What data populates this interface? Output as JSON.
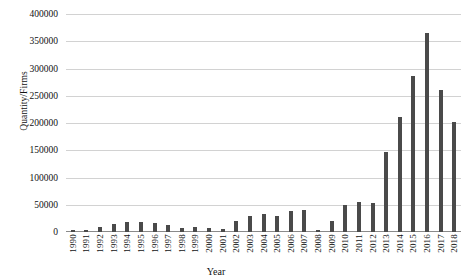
{
  "chart_data": {
    "type": "bar",
    "title": "",
    "xlabel": "Year",
    "ylabel": "Quantity/Firms",
    "ylim": [
      0,
      400000
    ],
    "ytick_step": 50000,
    "grid": true,
    "legend": "none",
    "bar_color": "#4a4a4a",
    "gridline_color": "#d2d2d2",
    "categories": [
      "1990",
      "1991",
      "1992",
      "1993",
      "1994",
      "1995",
      "1996",
      "1997",
      "1998",
      "1999",
      "2000",
      "2001",
      "2002",
      "2003",
      "2004",
      "2005",
      "2006",
      "2007",
      "2008",
      "2009",
      "2010",
      "2011",
      "2012",
      "2013",
      "2014",
      "2015",
      "2016",
      "2017",
      "2018"
    ],
    "values": [
      3000,
      4000,
      9000,
      14000,
      18000,
      18000,
      17000,
      13000,
      8000,
      9000,
      7000,
      5000,
      21000,
      30000,
      33000,
      30000,
      38000,
      40000,
      4000,
      20000,
      50000,
      55000,
      54000,
      147000,
      211000,
      287000,
      365000,
      260000,
      201000
    ],
    "ytick_labels": [
      "400000",
      "350000",
      "300000",
      "250000",
      "200000",
      "150000",
      "100000",
      "50000",
      "0"
    ],
    "ytick_values": [
      400000,
      350000,
      300000,
      250000,
      200000,
      150000,
      100000,
      50000,
      0
    ]
  }
}
